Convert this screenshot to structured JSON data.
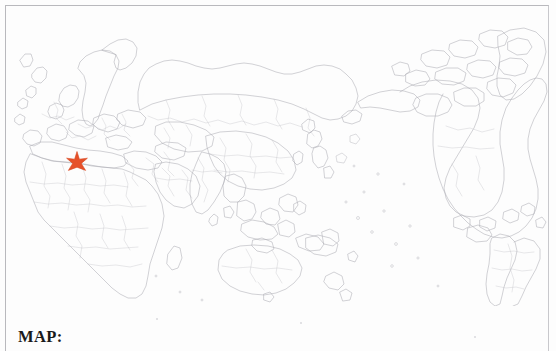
{
  "page": {
    "width": 556,
    "height": 351,
    "background_color": "#fdfdfd"
  },
  "map": {
    "title": "",
    "projection_note": "world outline map centered on Asia-Pacific",
    "frame_color": "#b9b9bd",
    "coastline_color": "#adadb4",
    "country_border_color": "#c4c4ca",
    "marker": {
      "icon": "star-marker-icon",
      "color": "#e6512a",
      "label": "",
      "x": 77,
      "y": 163
    }
  },
  "caption": {
    "label": "MAP:"
  }
}
